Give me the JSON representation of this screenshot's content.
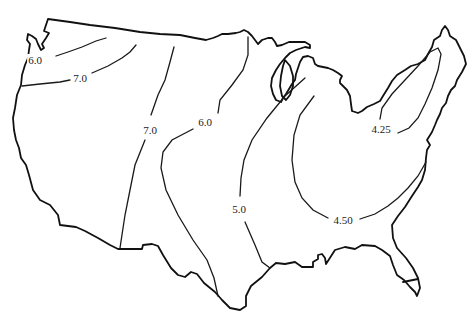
{
  "map": {
    "type": "isoline-contour-map",
    "region": "Continental United States",
    "colors": {
      "outline": "#111111",
      "contour": "#1a1a1a",
      "background": "#ffffff"
    },
    "contour_labels": [
      {
        "id": "nw-6-0",
        "value": "6.0",
        "x": 35,
        "y": 60
      },
      {
        "id": "nw-7-0",
        "value": "7.0",
        "x": 80,
        "y": 78
      },
      {
        "id": "west-7-0",
        "value": "7.0",
        "x": 150,
        "y": 130
      },
      {
        "id": "central-6-0",
        "value": "6.0",
        "x": 205,
        "y": 122
      },
      {
        "id": "south-5-0",
        "value": "5.0",
        "x": 239,
        "y": 209
      },
      {
        "id": "southeast-4-50",
        "value": "4.50",
        "x": 343,
        "y": 220
      },
      {
        "id": "northeast-4-25",
        "value": "4.25",
        "x": 381,
        "y": 129
      }
    ]
  }
}
